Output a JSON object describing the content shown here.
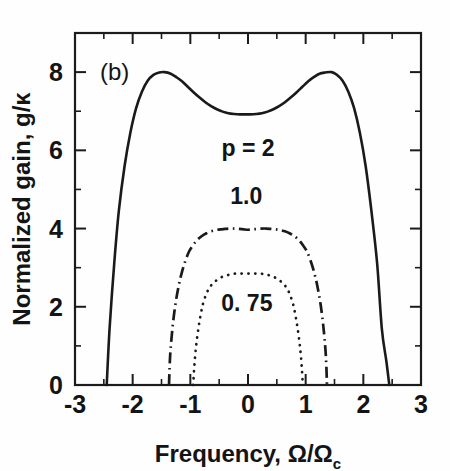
{
  "figure": {
    "panel_label": "(b)",
    "background_color": "#fefefe",
    "ink_color": "#1a1a1a"
  },
  "chart_data": {
    "type": "line",
    "title": "",
    "subtitle": "",
    "panel": "(b)",
    "xlabel": "Frequency, Ω/Ω",
    "xlabel_subscript": "c",
    "ylabel": "Normalized gain, g/κ",
    "xlim": [
      -3,
      3
    ],
    "ylim": [
      0,
      9
    ],
    "xticks": [
      -3,
      -2,
      -1,
      0,
      1,
      2,
      3
    ],
    "xtick_labels": [
      "-3",
      "-2",
      "-1",
      "0",
      "1",
      "2",
      "3"
    ],
    "xticks_minor": [
      -2.5,
      -1.5,
      -0.5,
      0.5,
      1.5,
      2.5
    ],
    "yticks": [
      0,
      2,
      4,
      6,
      8
    ],
    "ytick_labels": [
      "0",
      "2",
      "4",
      "6",
      "8"
    ],
    "yticks_minor": [
      1,
      3,
      5,
      7
    ],
    "grid": false,
    "legend_position": "inline-annotations",
    "series": [
      {
        "name": "p = 2",
        "label": "p = 2",
        "label_x": 0.0,
        "label_y": 5.85,
        "linestyle": "solid",
        "peak_value": 8.0,
        "peak_x": [
          -1.45,
          1.45
        ],
        "center_dip_value": 6.92,
        "cutoff_x": [
          -2.45,
          2.45
        ],
        "x": [
          -2.45,
          -2.4,
          -2.32,
          -2.24,
          -2.14,
          -2.04,
          -1.94,
          -1.84,
          -1.74,
          -1.64,
          -1.54,
          -1.45,
          -1.34,
          -1.24,
          -1.14,
          -1.04,
          -0.94,
          -0.84,
          -0.74,
          -0.64,
          -0.54,
          -0.44,
          -0.34,
          -0.24,
          -0.14,
          -0.04,
          0.0,
          0.04,
          0.14,
          0.24,
          0.34,
          0.44,
          0.54,
          0.64,
          0.74,
          0.84,
          0.94,
          1.04,
          1.14,
          1.24,
          1.34,
          1.45,
          1.54,
          1.64,
          1.74,
          1.84,
          1.94,
          2.04,
          2.14,
          2.24,
          2.32,
          2.4,
          2.45
        ],
        "y": [
          0.0,
          1.45,
          3.1,
          4.45,
          5.6,
          6.45,
          7.08,
          7.5,
          7.78,
          7.93,
          7.99,
          8.0,
          7.96,
          7.87,
          7.76,
          7.62,
          7.48,
          7.35,
          7.23,
          7.13,
          7.05,
          6.99,
          6.95,
          6.93,
          6.92,
          6.92,
          6.92,
          6.92,
          6.93,
          6.95,
          6.99,
          7.05,
          7.13,
          7.23,
          7.35,
          7.48,
          7.62,
          7.76,
          7.87,
          7.96,
          7.99,
          8.0,
          7.93,
          7.78,
          7.5,
          7.08,
          6.45,
          5.6,
          4.45,
          3.1,
          1.45,
          0.6,
          0.0
        ]
      },
      {
        "name": "1.0",
        "label": "1.0",
        "label_x": -0.03,
        "label_y": 4.62,
        "linestyle": "dash-dot",
        "peak_value": 4.0,
        "peak_x": [
          -0.25,
          0.25
        ],
        "center_dip_value": 3.96,
        "cutoff_x": [
          -1.37,
          1.37
        ],
        "x": [
          -1.37,
          -1.35,
          -1.31,
          -1.26,
          -1.2,
          -1.14,
          -1.08,
          -1.02,
          -0.95,
          -0.88,
          -0.8,
          -0.72,
          -0.64,
          -0.56,
          -0.48,
          -0.4,
          -0.32,
          -0.24,
          -0.16,
          -0.08,
          0.0,
          0.08,
          0.16,
          0.24,
          0.32,
          0.4,
          0.48,
          0.56,
          0.64,
          0.72,
          0.8,
          0.88,
          0.95,
          1.02,
          1.08,
          1.14,
          1.2,
          1.26,
          1.31,
          1.35,
          1.37
        ],
        "y": [
          0.0,
          0.75,
          1.45,
          2.05,
          2.55,
          2.92,
          3.2,
          3.42,
          3.58,
          3.71,
          3.81,
          3.88,
          3.93,
          3.96,
          3.98,
          3.99,
          4.0,
          4.0,
          3.99,
          3.98,
          3.97,
          3.98,
          3.99,
          4.0,
          4.0,
          3.99,
          3.98,
          3.96,
          3.93,
          3.88,
          3.81,
          3.71,
          3.58,
          3.42,
          3.2,
          2.92,
          2.55,
          2.05,
          1.45,
          0.75,
          0.0
        ]
      },
      {
        "name": "0.75",
        "label": "0. 75",
        "label_x": -0.02,
        "label_y": 1.9,
        "linestyle": "dotted",
        "peak_value": 2.85,
        "peak_x": [
          0.0
        ],
        "cutoff_x": [
          -0.95,
          0.95
        ],
        "x": [
          -0.95,
          -0.93,
          -0.9,
          -0.86,
          -0.82,
          -0.78,
          -0.73,
          -0.68,
          -0.62,
          -0.56,
          -0.5,
          -0.44,
          -0.38,
          -0.32,
          -0.26,
          -0.2,
          -0.14,
          -0.08,
          0.0,
          0.08,
          0.14,
          0.2,
          0.26,
          0.32,
          0.38,
          0.44,
          0.5,
          0.56,
          0.62,
          0.68,
          0.73,
          0.78,
          0.82,
          0.86,
          0.9,
          0.93,
          0.95
        ],
        "y": [
          0.0,
          0.5,
          1.0,
          1.45,
          1.8,
          2.08,
          2.3,
          2.46,
          2.58,
          2.66,
          2.72,
          2.77,
          2.8,
          2.82,
          2.84,
          2.85,
          2.85,
          2.85,
          2.85,
          2.85,
          2.85,
          2.85,
          2.84,
          2.82,
          2.8,
          2.77,
          2.72,
          2.66,
          2.58,
          2.46,
          2.3,
          2.08,
          1.8,
          1.45,
          1.0,
          0.5,
          0.0
        ]
      }
    ]
  }
}
